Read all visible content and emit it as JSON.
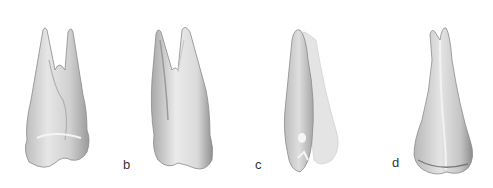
{
  "figure": {
    "panels": [
      {
        "id": "a",
        "label": "",
        "view": "tooth-view-1"
      },
      {
        "id": "b",
        "label": "b",
        "view": "tooth-view-2"
      },
      {
        "id": "c",
        "label": "c",
        "view": "tooth-view-3"
      },
      {
        "id": "d",
        "label": "d",
        "view": "tooth-view-4"
      }
    ]
  }
}
